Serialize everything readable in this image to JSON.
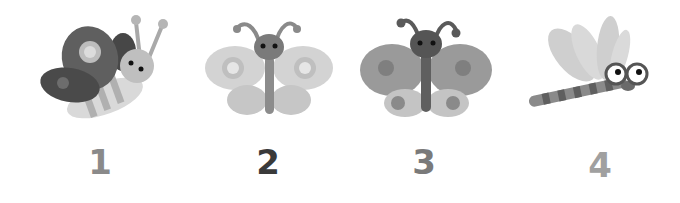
{
  "items": [
    {
      "label": "1",
      "subject": "butterfly-side-view",
      "label_color": "#8a8a8a"
    },
    {
      "label": "2",
      "subject": "butterfly-light-wings",
      "label_color": "#3a3a3a"
    },
    {
      "label": "3",
      "subject": "butterfly-medium-wings",
      "label_color": "#7a7a7a"
    },
    {
      "label": "4",
      "subject": "dragonfly",
      "label_color": "#a0a0a0"
    }
  ]
}
